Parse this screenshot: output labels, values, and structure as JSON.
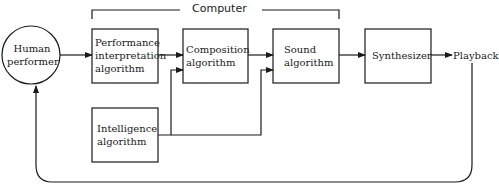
{
  "diagram": {
    "group": {
      "label": "Computer"
    },
    "nodes": {
      "human": {
        "line1": "Human",
        "line2": "performer"
      },
      "performance": {
        "line1": "Performance",
        "line2": "interpretation",
        "line3": "algorithm"
      },
      "composition": {
        "line1": "Composition",
        "line2": "algorithm"
      },
      "sound": {
        "line1": "Sound",
        "line2": "algorithm"
      },
      "synthesizer": {
        "line1": "Synthesizer"
      },
      "intelligence": {
        "line1": "Intelligence",
        "line2": "algorithm"
      },
      "playback": {
        "line1": "Playback"
      }
    },
    "edges": [
      {
        "from": "Human performer",
        "to": "Performance interpretation algorithm"
      },
      {
        "from": "Performance interpretation algorithm",
        "to": "Composition algorithm"
      },
      {
        "from": "Composition algorithm",
        "to": "Sound algorithm"
      },
      {
        "from": "Sound algorithm",
        "to": "Synthesizer"
      },
      {
        "from": "Synthesizer",
        "to": "Playback"
      },
      {
        "from": "Intelligence algorithm",
        "to": "Composition algorithm"
      },
      {
        "from": "Intelligence algorithm",
        "to": "Sound algorithm"
      },
      {
        "from": "Playback",
        "to": "Human performer"
      }
    ]
  }
}
